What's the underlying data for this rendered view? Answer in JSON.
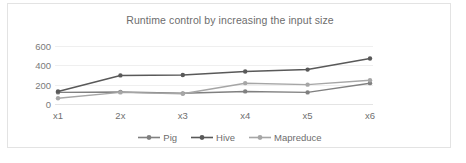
{
  "chart_data": {
    "type": "line",
    "title": "Runtime control by increasing the input size",
    "xlabel": "",
    "ylabel": "",
    "categories": [
      "x1",
      "2x",
      "x3",
      "x4",
      "x5",
      "x6"
    ],
    "yticks": [
      0,
      200,
      400,
      600
    ],
    "ylim": [
      0,
      640
    ],
    "grid": true,
    "legend_position": "bottom",
    "series": [
      {
        "name": "Pig",
        "values": [
          120,
          125,
          110,
          130,
          120,
          215
        ],
        "color": "#808080"
      },
      {
        "name": "Hive",
        "values": [
          130,
          295,
          300,
          335,
          355,
          470
        ],
        "color": "#595959"
      },
      {
        "name": "Mapreduce",
        "values": [
          60,
          120,
          105,
          215,
          200,
          245
        ],
        "color": "#a6a6a6"
      }
    ]
  },
  "legend": {
    "items": [
      {
        "label": "Pig"
      },
      {
        "label": "Hive"
      },
      {
        "label": "Mapreduce"
      }
    ]
  }
}
